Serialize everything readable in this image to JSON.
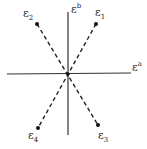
{
  "diagram": {
    "axes": {
      "horizontal_label": "ε",
      "horizontal_sup": "a",
      "vertical_label": "ε",
      "vertical_sup": "b"
    },
    "points": [
      {
        "label": "ε",
        "sub": "1",
        "x": 96,
        "y": 24
      },
      {
        "label": "ε",
        "sub": "2",
        "x": 37,
        "y": 24
      },
      {
        "label": "ε",
        "sub": "3",
        "x": 98,
        "y": 125
      },
      {
        "label": "ε",
        "sub": "4",
        "x": 38,
        "y": 128
      }
    ],
    "origin": {
      "x": 68,
      "y": 74
    }
  }
}
